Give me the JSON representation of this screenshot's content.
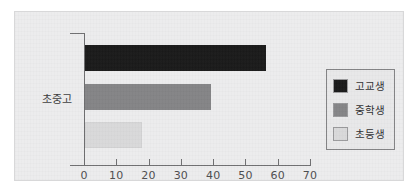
{
  "chart_data": {
    "type": "bar",
    "orientation": "horizontal",
    "title": "",
    "subtitle": "",
    "xlabel": "",
    "ylabel": "",
    "categories": [
      "초중고"
    ],
    "series": [
      {
        "name": "고교생",
        "values": [
          56
        ],
        "color": "#191919"
      },
      {
        "name": "중학생",
        "values": [
          39
        ],
        "color": "#848486"
      },
      {
        "name": "초등생",
        "values": [
          17
        ],
        "color": "#d9d9da"
      }
    ],
    "xlim": [
      0,
      70
    ],
    "xticks": [
      0,
      10,
      20,
      30,
      40,
      50,
      60,
      70
    ],
    "xtick_labels": [
      "0",
      "10",
      "20",
      "30",
      "40",
      "50",
      "60",
      "70"
    ],
    "grid": false,
    "legend_position": "right",
    "plot_background": "#ececed",
    "axis_color": "#6e6e70"
  },
  "legend": {
    "items": [
      {
        "label": "고교생",
        "swatch": "#191919"
      },
      {
        "label": "중학생",
        "swatch": "#848486"
      },
      {
        "label": "초등생",
        "swatch": "#d9d9da"
      }
    ]
  },
  "axis": {
    "category_label": "초중고"
  }
}
